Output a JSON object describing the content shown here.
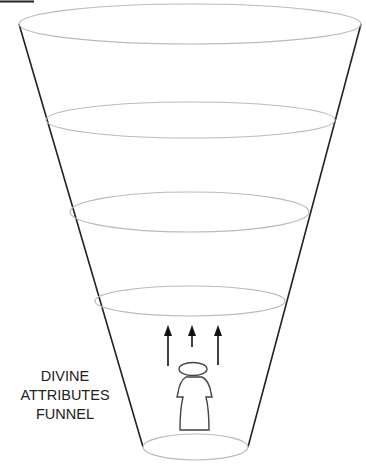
{
  "diagram": {
    "title_lines": [
      "DIVINE",
      "ATTRIBUTES",
      "FUNNEL"
    ],
    "colors": {
      "funnel_outline": "#222222",
      "tier_ellipse": "#bbbbbb",
      "figure_outline": "#444444",
      "arrow": "#111111",
      "label_text": "#222222"
    },
    "funnel": {
      "tiers": [
        {
          "cx": 190,
          "cy": 24,
          "rx": 171,
          "ry": 20
        },
        {
          "cx": 190.5,
          "cy": 120,
          "rx": 144.5,
          "ry": 18
        },
        {
          "cx": 189.5,
          "cy": 212,
          "rx": 119.5,
          "ry": 20
        },
        {
          "cx": 190,
          "cy": 301,
          "rx": 95,
          "ry": 15
        },
        {
          "cx": 195.5,
          "cy": 447,
          "rx": 52.5,
          "ry": 13
        }
      ]
    },
    "arrows": [
      {
        "x": 168,
        "y_tail": 366,
        "y_tip": 325
      },
      {
        "x": 192,
        "y_tail": 347,
        "y_tip": 325
      },
      {
        "x": 218,
        "y_tail": 365,
        "y_tip": 325
      }
    ],
    "figure": {
      "label": "person-figure"
    }
  }
}
